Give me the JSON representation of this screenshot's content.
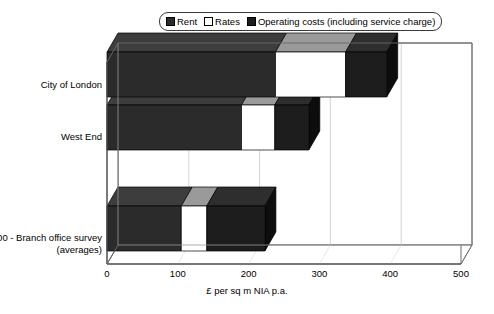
{
  "legend": {
    "position": "top-center",
    "items": [
      {
        "label": "Rent",
        "color": "#2b2b2b",
        "swatch": "rent-swatch"
      },
      {
        "label": "Rates",
        "color": "#ffffff",
        "swatch": "rates-swatch"
      },
      {
        "label": "Operating costs (including service charge)",
        "color": "#1d1d1d",
        "swatch": "operating-costs-swatch"
      }
    ]
  },
  "chart_data": {
    "type": "bar",
    "orientation": "horizontal",
    "stacked": true,
    "three_d": true,
    "title": "",
    "xlabel": "£ per sq m NIA p.a.",
    "ylabel": "",
    "xlim": [
      0,
      500
    ],
    "xticks": [
      0,
      100,
      200,
      300,
      400,
      500
    ],
    "xtick_labels": [
      "0",
      "100",
      "200",
      "300",
      "400",
      "500"
    ],
    "grid": true,
    "categories": [
      "City of London",
      "West End",
      "",
      "100 - Branch office survey (averages)"
    ],
    "series": [
      {
        "name": "Rent",
        "color": "#2b2b2b",
        "values": [
          238,
          190,
          null,
          105
        ]
      },
      {
        "name": "Rates",
        "color": "#ffffff",
        "values": [
          99,
          47,
          null,
          36
        ]
      },
      {
        "name": "Operating costs (including service charge)",
        "color": "#1d1d1d",
        "values": [
          58,
          48,
          null,
          82
        ]
      }
    ],
    "totals": [
      395,
      285,
      null,
      223
    ]
  },
  "colors": {
    "rent": "#2b2b2b",
    "rent_top": "#3d3d3d",
    "rent_side": "#141414",
    "rates": "#ffffff",
    "rates_top": "#9a9a9a",
    "rates_side": "#d8d8d8",
    "operating": "#1d1d1d",
    "operating_top": "#2e2e2e",
    "operating_side": "#0d0d0d",
    "frame": "#5a5a5a",
    "grid": "#c9c9c9",
    "text": "#000000"
  }
}
